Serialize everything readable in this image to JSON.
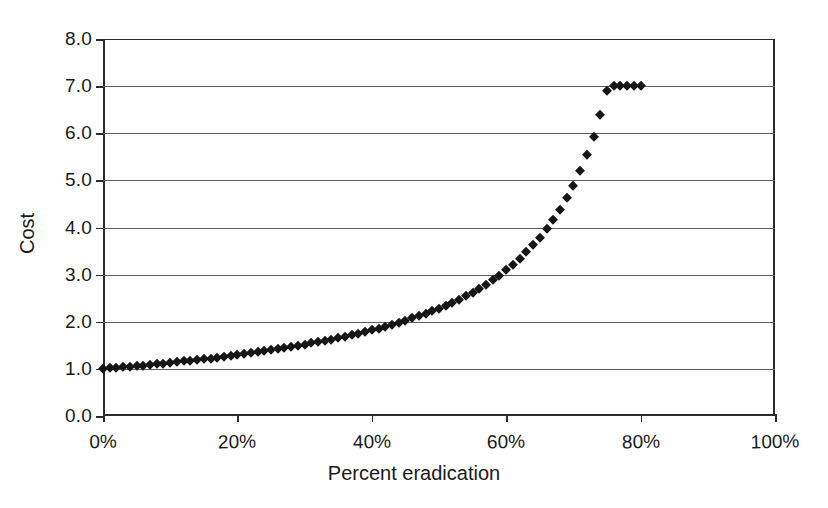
{
  "chart_data": {
    "type": "scatter",
    "title": "",
    "xlabel": "Percent eradication",
    "ylabel": "Cost",
    "xlim": [
      0,
      100
    ],
    "ylim": [
      0,
      8
    ],
    "grid": true,
    "legend": false,
    "marker": "diamond",
    "marker_color": "#161616",
    "x_tick_labels": [
      "0%",
      "20%",
      "40%",
      "60%",
      "80%",
      "100%"
    ],
    "x_tick_values": [
      0,
      20,
      40,
      60,
      80,
      100
    ],
    "y_tick_labels": [
      "0.0",
      "1.0",
      "2.0",
      "3.0",
      "4.0",
      "5.0",
      "6.0",
      "7.0",
      "8.0"
    ],
    "y_tick_values": [
      0,
      1,
      2,
      3,
      4,
      5,
      6,
      7,
      8
    ],
    "x": [
      0,
      1,
      2,
      3,
      4,
      5,
      6,
      7,
      8,
      9,
      10,
      11,
      12,
      13,
      14,
      15,
      16,
      17,
      18,
      19,
      20,
      21,
      22,
      23,
      24,
      25,
      26,
      27,
      28,
      29,
      30,
      31,
      32,
      33,
      34,
      35,
      36,
      37,
      38,
      39,
      40,
      41,
      42,
      43,
      44,
      45,
      46,
      47,
      48,
      49,
      50,
      51,
      52,
      53,
      54,
      55,
      56,
      57,
      58,
      59,
      60,
      61,
      62,
      63,
      64,
      65,
      66,
      67,
      68,
      69,
      70,
      71,
      72,
      73,
      74,
      75,
      76,
      77,
      78,
      79,
      80
    ],
    "y": [
      1.0,
      1.01,
      1.02,
      1.03,
      1.05,
      1.06,
      1.07,
      1.08,
      1.1,
      1.11,
      1.13,
      1.14,
      1.16,
      1.17,
      1.19,
      1.2,
      1.22,
      1.24,
      1.26,
      1.27,
      1.29,
      1.31,
      1.33,
      1.35,
      1.37,
      1.39,
      1.42,
      1.44,
      1.46,
      1.49,
      1.51,
      1.54,
      1.56,
      1.59,
      1.62,
      1.65,
      1.68,
      1.71,
      1.75,
      1.78,
      1.82,
      1.85,
      1.89,
      1.93,
      1.98,
      2.02,
      2.07,
      2.12,
      2.17,
      2.22,
      2.28,
      2.34,
      2.4,
      2.47,
      2.54,
      2.62,
      2.7,
      2.79,
      2.88,
      2.98,
      3.09,
      3.2,
      3.33,
      3.47,
      3.62,
      3.78,
      3.96,
      4.16,
      4.38,
      4.62,
      4.89,
      5.19,
      5.54,
      5.93,
      6.38,
      6.9,
      7.0,
      7.0,
      7.0,
      7.0,
      7.0
    ]
  },
  "axes": {
    "y_title": "Cost",
    "x_title": "Percent eradication"
  }
}
